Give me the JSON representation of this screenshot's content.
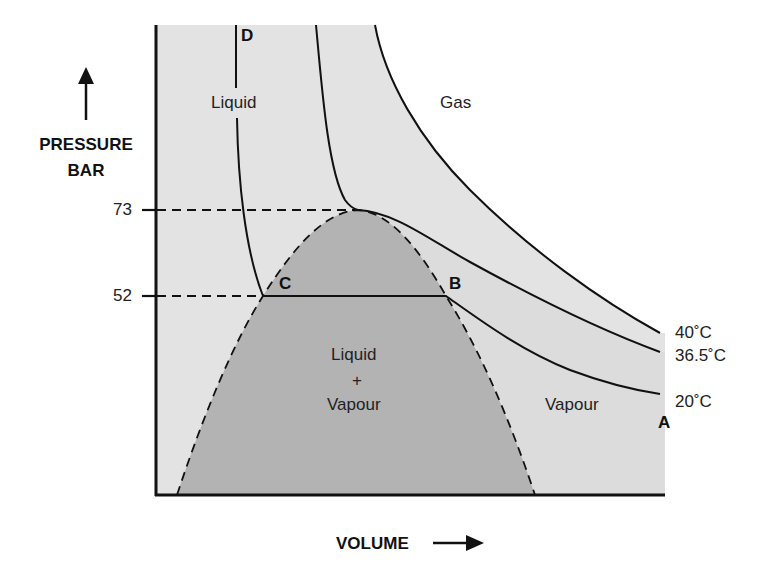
{
  "y_axis": {
    "title_line1": "PRESSURE",
    "title_line2": "BAR",
    "ticks": [
      {
        "label": "73",
        "value": 73
      },
      {
        "label": "52",
        "value": 52
      }
    ]
  },
  "x_axis": {
    "title": "VOLUME"
  },
  "regions": {
    "liquid": "Liquid",
    "gas": "Gas",
    "mix_line1": "Liquid",
    "mix_line2": "+",
    "mix_line3": "Vapour",
    "vapour": "Vapour"
  },
  "points": {
    "a": "A",
    "b": "B",
    "c": "C",
    "d": "D"
  },
  "isotherms": [
    {
      "label": "40˚C",
      "temperature_c": 40
    },
    {
      "label": "36.5˚C",
      "temperature_c": 36.5
    },
    {
      "label": "20˚C",
      "temperature_c": 20
    }
  ],
  "colors": {
    "liquid_fill": "#e4e4e4",
    "vapour_fill": "#dedede",
    "dome_fill": "#b3b3b3",
    "gas_fill": "#ffffff",
    "line": "#111111"
  }
}
